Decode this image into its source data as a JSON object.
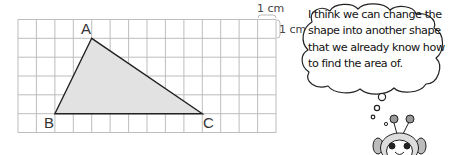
{
  "grid": {
    "columns": 14,
    "rows": 6,
    "cell_size_label": "1 cm",
    "unit_width_label": "1 cm",
    "unit_height_label": "1 cm",
    "line_color": "#bdbdbd"
  },
  "triangle": {
    "fill_color": "#e2e2e2",
    "stroke_color": "#222222",
    "vertices": [
      {
        "label": "A",
        "col": 4,
        "row": 1
      },
      {
        "label": "B",
        "col": 2,
        "row": 5
      },
      {
        "label": "C",
        "col": 10,
        "row": 5
      }
    ]
  },
  "speech_bubble": {
    "lines": [
      "I think we can change the",
      "shape into another shape",
      "that we already know how",
      "to find the area of."
    ]
  },
  "character": {
    "name": "robot-mascot"
  }
}
